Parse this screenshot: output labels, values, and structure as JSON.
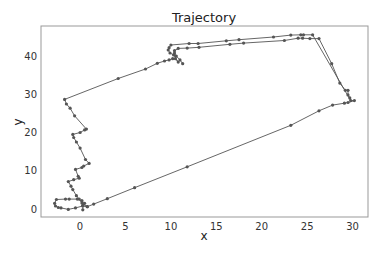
{
  "chart_data": {
    "type": "line",
    "title": "Trajectory",
    "xlabel": "x",
    "ylabel": "y",
    "xlim": [
      -4.3,
      31.7
    ],
    "ylim": [
      -2.1,
      48.1
    ],
    "xticks": [
      0,
      5,
      10,
      15,
      20,
      25,
      30
    ],
    "yticks": [
      0,
      10,
      20,
      30,
      40
    ],
    "grid": false,
    "legend": null,
    "marker": "o",
    "line_color": "#555555",
    "marker_color": "#555555",
    "series": [
      {
        "name": "trajectory",
        "points": [
          [
            0.3,
            -0.2
          ],
          [
            0.3,
            1.0
          ],
          [
            0.5,
            1.5
          ],
          [
            0.2,
            2.2
          ],
          [
            -0.3,
            2.6
          ],
          [
            -1.2,
            2.6
          ],
          [
            -1.6,
            2.6
          ],
          [
            -2.6,
            2.5
          ],
          [
            -2.8,
            1.5
          ],
          [
            -2.7,
            0.8
          ],
          [
            -2.4,
            0.4
          ],
          [
            -2.1,
            0.3
          ],
          [
            -1.3,
            -0.1
          ],
          [
            -0.5,
            0.3
          ],
          [
            0.3,
            0.8
          ],
          [
            0.8,
            0.6
          ],
          [
            0.2,
            1.6
          ],
          [
            -0.1,
            2.6
          ],
          [
            -0.4,
            3.5
          ],
          [
            -0.8,
            5.1
          ],
          [
            -1.0,
            6.0
          ],
          [
            -1.3,
            7.2
          ],
          [
            -0.7,
            7.7
          ],
          [
            -0.1,
            8.1
          ],
          [
            -0.2,
            8.6
          ],
          [
            -0.5,
            10.4
          ],
          [
            0.2,
            10.9
          ],
          [
            0.4,
            11.3
          ],
          [
            1.0,
            12.0
          ],
          [
            0.6,
            13.0
          ],
          [
            0.0,
            16.0
          ],
          [
            -0.4,
            17.6
          ],
          [
            -0.7,
            18.8
          ],
          [
            -0.8,
            19.6
          ],
          [
            0.0,
            20.1
          ],
          [
            0.5,
            20.8
          ],
          [
            0.7,
            21.0
          ],
          [
            -0.6,
            24.5
          ],
          [
            -1.1,
            26.5
          ],
          [
            -1.5,
            27.6
          ],
          [
            -1.7,
            28.8
          ],
          [
            4.2,
            34.3
          ],
          [
            7.2,
            36.8
          ],
          [
            8.5,
            38.3
          ],
          [
            9.3,
            38.9
          ],
          [
            9.8,
            39.2
          ],
          [
            10.2,
            39.5
          ],
          [
            10.5,
            39.5
          ],
          [
            10.8,
            38.6
          ],
          [
            10.3,
            40.5
          ],
          [
            9.9,
            41.0
          ],
          [
            9.7,
            41.8
          ],
          [
            9.8,
            42.4
          ],
          [
            10.0,
            43.1
          ],
          [
            12.0,
            43.5
          ],
          [
            13.0,
            43.5
          ],
          [
            16.1,
            44.2
          ],
          [
            17.5,
            44.5
          ],
          [
            21.3,
            45.2
          ],
          [
            23.2,
            45.7
          ],
          [
            24.3,
            45.8
          ],
          [
            24.6,
            45.8
          ],
          [
            25.6,
            45.8
          ],
          [
            29.8,
            28.5
          ],
          [
            29.7,
            29.2
          ],
          [
            29.5,
            30.0
          ],
          [
            29.5,
            31.2
          ],
          [
            29.2,
            31.2
          ],
          [
            28.6,
            33.1
          ],
          [
            27.7,
            38.2
          ],
          [
            26.3,
            44.8
          ],
          [
            25.3,
            44.8
          ],
          [
            24.5,
            44.9
          ],
          [
            24.0,
            44.9
          ],
          [
            22.5,
            44.3
          ],
          [
            18.0,
            43.6
          ],
          [
            16.5,
            43.3
          ],
          [
            13.1,
            42.5
          ],
          [
            11.8,
            42.3
          ],
          [
            10.8,
            42.2
          ],
          [
            10.4,
            41.6
          ],
          [
            10.4,
            41.0
          ],
          [
            10.6,
            40.2
          ],
          [
            11.0,
            39.2
          ],
          [
            11.3,
            38.2
          ]
        ]
      },
      {
        "name": "trajectory-return",
        "points": [
          [
            30.2,
            28.5
          ],
          [
            29.5,
            28.0
          ],
          [
            29.1,
            27.8
          ],
          [
            27.8,
            27.3
          ],
          [
            26.3,
            25.8
          ],
          [
            23.2,
            22.0
          ],
          [
            11.8,
            11.1
          ],
          [
            6.0,
            5.6
          ],
          [
            3.0,
            2.7
          ],
          [
            1.5,
            1.3
          ],
          [
            0.8,
            0.6
          ]
        ]
      }
    ]
  }
}
